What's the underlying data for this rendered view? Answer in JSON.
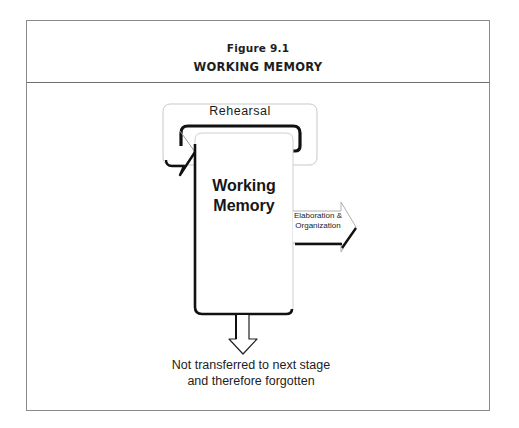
{
  "figure": {
    "number_label": "Figure 9.1",
    "title": "WORKING MEMORY"
  },
  "diagram": {
    "rehearsal_label": "Rehearsal",
    "working_memory_label_line1": "Working",
    "working_memory_label_line2": "Memory",
    "elaboration_label_line1": "Elaboration &",
    "elaboration_label_line2": "Organization",
    "forgotten_label_line1": "Not transferred to next stage",
    "forgotten_label_line2": "and therefore forgotten"
  },
  "colors": {
    "frame_border": "#8a8a8a",
    "ink": "#1a1a1a",
    "light_outline": "#c8c8c8"
  }
}
